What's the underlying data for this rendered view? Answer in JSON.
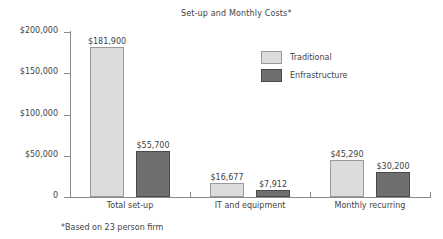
{
  "chart_data": {
    "type": "bar",
    "title": "Set-up and Monthly Costs*",
    "subtitle": "",
    "xlabel": "",
    "ylabel": "",
    "categories": [
      "Total set-up",
      "IT and equipment",
      "Monthly recurring"
    ],
    "series": [
      {
        "name": "Traditional",
        "color": "#dcdcdc",
        "values": [
          181900,
          16677,
          45290
        ],
        "value_labels": [
          "$181,900",
          "$16,677",
          "$45,290"
        ]
      },
      {
        "name": "Enfrastructure",
        "color": "#6f6f6f",
        "values": [
          55700,
          7912,
          30200
        ],
        "value_labels": [
          "$55,700",
          "$7,912",
          "$30,200"
        ]
      }
    ],
    "ylim": [
      0,
      200000
    ],
    "yticks": [
      0,
      50000,
      100000,
      150000,
      200000
    ],
    "ytick_labels": [
      "0",
      "$50,000",
      "$100,000",
      "$150,000",
      "$200,000"
    ],
    "grid": false,
    "legend_position": "upper-center-right",
    "annotations": [
      "*Based on 23 person firm"
    ]
  },
  "legend": {
    "entries": [
      {
        "label": "Traditional"
      },
      {
        "label": "Enfrastructure"
      }
    ]
  },
  "footnote": {
    "text": "*Based on 23 person firm"
  }
}
